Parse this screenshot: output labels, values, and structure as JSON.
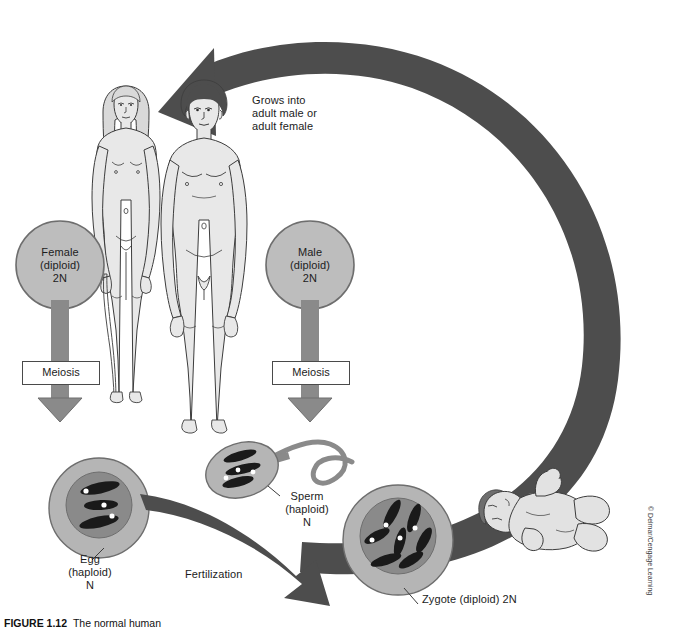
{
  "figure": {
    "number_label": "FIGURE 1.12",
    "caption_text": "The normal human",
    "copyright": "© Delmar/Cengage Learning"
  },
  "labels": {
    "grows_into": "Grows into\nadult male or\nadult female",
    "female_circle": "Female\n(diploid)\n2N",
    "male_circle": "Male\n(diploid)\n2N",
    "meiosis_left": "Meiosis",
    "meiosis_right": "Meiosis",
    "egg": "Egg\n(haploid)\nN",
    "sperm": "Sperm\n(haploid)\nN",
    "zygote": "Zygote (diploid) 2N",
    "fertilization": "Fertilization"
  },
  "diagram": {
    "type": "cycle-diagram",
    "stages": [
      {
        "name": "adult-female",
        "ploidy": "diploid",
        "ploidy_symbol": "2N"
      },
      {
        "name": "adult-male",
        "ploidy": "diploid",
        "ploidy_symbol": "2N"
      },
      {
        "name": "egg",
        "ploidy": "haploid",
        "ploidy_symbol": "N",
        "chromosome_count": 3
      },
      {
        "name": "sperm",
        "ploidy": "haploid",
        "ploidy_symbol": "N",
        "chromosome_count": 3
      },
      {
        "name": "zygote",
        "ploidy": "diploid",
        "ploidy_symbol": "2N",
        "chromosome_count": 6
      },
      {
        "name": "baby",
        "ploidy": "diploid",
        "ploidy_symbol": "2N"
      }
    ],
    "processes": [
      "Meiosis",
      "Fertilization",
      "Grows into adult male or adult female"
    ]
  },
  "colors": {
    "arrow_dark": "#4d4d4d",
    "arrow_mid": "#808080",
    "cell_outer": "#b5b5b5",
    "cell_nucleus": "#8a8a8a",
    "chromosome": "#1a1a1a",
    "centromere": "#ffffff",
    "skin": "#e2e2e2",
    "hair": "#4d4d4d",
    "outline": "#3c3c3c",
    "background": "#ffffff",
    "text": "#1c1c1c"
  }
}
